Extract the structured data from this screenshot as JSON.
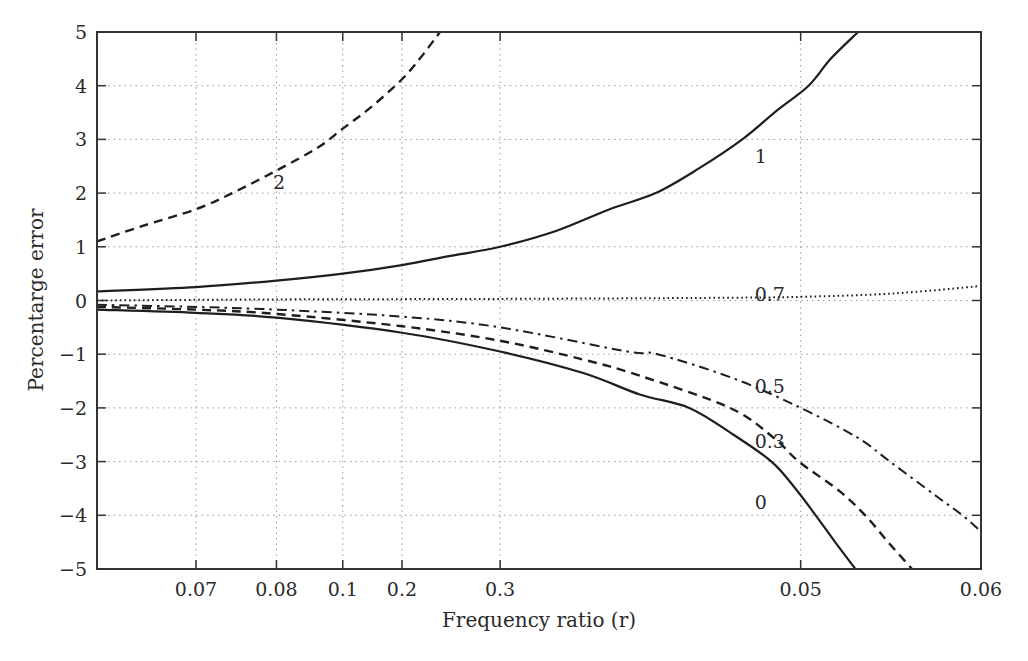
{
  "chart_data": {
    "type": "line",
    "title": "",
    "xlabel": "Frequency ratio (r)",
    "ylabel": "Percentarge error",
    "ylim": [
      -5,
      5
    ],
    "yticks": [
      -5,
      -4,
      -3,
      -2,
      -1,
      0,
      1,
      2,
      3,
      4,
      5
    ],
    "ytick_labels": [
      "−5",
      "−4",
      "−3",
      "−2",
      "−1",
      "0",
      "1",
      "2",
      "3",
      "4",
      "5"
    ],
    "grid": true,
    "grid_style": "dotted",
    "legend": "none (inline curve labels)",
    "x_axis_note": "non-uniform tick labels; positions given as fraction of plot width",
    "xticks": [
      {
        "label": "0.07",
        "pos": 0.112
      },
      {
        "label": "0.08",
        "pos": 0.203
      },
      {
        "label": "0.1",
        "pos": 0.278
      },
      {
        "label": "0.2",
        "pos": 0.345
      },
      {
        "label": "0.3",
        "pos": 0.456
      },
      {
        "label": "0.05",
        "pos": 0.796
      },
      {
        "label": "0.06",
        "pos": 1.0
      }
    ],
    "series": [
      {
        "name": "2",
        "style": "dashed",
        "points": [
          [
            0.0,
            1.1
          ],
          [
            0.05,
            1.38
          ],
          [
            0.112,
            1.7
          ],
          [
            0.153,
            2.0
          ],
          [
            0.203,
            2.42
          ],
          [
            0.25,
            2.85
          ],
          [
            0.278,
            3.2
          ],
          [
            0.31,
            3.6
          ],
          [
            0.345,
            4.12
          ],
          [
            0.365,
            4.5
          ],
          [
            0.388,
            5.0
          ]
        ],
        "label_pos": [
          0.19,
          2.2
        ]
      },
      {
        "name": "1",
        "style": "solid",
        "points": [
          [
            0.0,
            0.17
          ],
          [
            0.112,
            0.25
          ],
          [
            0.203,
            0.37
          ],
          [
            0.278,
            0.5
          ],
          [
            0.345,
            0.66
          ],
          [
            0.4,
            0.83
          ],
          [
            0.456,
            1.0
          ],
          [
            0.52,
            1.3
          ],
          [
            0.58,
            1.7
          ],
          [
            0.632,
            2.0
          ],
          [
            0.68,
            2.45
          ],
          [
            0.73,
            3.0
          ],
          [
            0.77,
            3.55
          ],
          [
            0.805,
            4.0
          ],
          [
            0.83,
            4.5
          ],
          [
            0.861,
            5.0
          ]
        ],
        "label_pos": [
          0.735,
          2.7
        ]
      },
      {
        "name": "0.7",
        "style": "dotted",
        "points": [
          [
            0.0,
            0.0
          ],
          [
            0.2,
            0.02
          ],
          [
            0.456,
            0.03
          ],
          [
            0.7,
            0.05
          ],
          [
            0.8,
            0.07
          ],
          [
            0.9,
            0.13
          ],
          [
            1.0,
            0.27
          ]
        ],
        "label_pos": [
          0.735,
          0.12
        ]
      },
      {
        "name": "0.5",
        "style": "dashdot",
        "points": [
          [
            0.0,
            -0.08
          ],
          [
            0.112,
            -0.12
          ],
          [
            0.203,
            -0.17
          ],
          [
            0.345,
            -0.3
          ],
          [
            0.456,
            -0.5
          ],
          [
            0.6,
            -0.95
          ],
          [
            0.634,
            -1.0
          ],
          [
            0.72,
            -1.45
          ],
          [
            0.796,
            -2.0
          ],
          [
            0.86,
            -2.55
          ],
          [
            0.897,
            -3.0
          ],
          [
            0.95,
            -3.65
          ],
          [
            0.979,
            -4.0
          ],
          [
            1.0,
            -4.3
          ]
        ],
        "label_pos": [
          0.735,
          -1.6
        ]
      },
      {
        "name": "0.3",
        "style": "dashed",
        "points": [
          [
            0.0,
            -0.12
          ],
          [
            0.112,
            -0.17
          ],
          [
            0.203,
            -0.25
          ],
          [
            0.345,
            -0.48
          ],
          [
            0.456,
            -0.75
          ],
          [
            0.55,
            -1.1
          ],
          [
            0.614,
            -1.4
          ],
          [
            0.716,
            -2.0
          ],
          [
            0.765,
            -2.55
          ],
          [
            0.794,
            -3.0
          ],
          [
            0.84,
            -3.55
          ],
          [
            0.869,
            -4.0
          ],
          [
            0.895,
            -4.5
          ],
          [
            0.922,
            -5.0
          ]
        ],
        "label_pos": [
          0.735,
          -2.62
        ]
      },
      {
        "name": "0",
        "style": "solid",
        "points": [
          [
            0.0,
            -0.17
          ],
          [
            0.112,
            -0.23
          ],
          [
            0.203,
            -0.32
          ],
          [
            0.345,
            -0.6
          ],
          [
            0.456,
            -0.95
          ],
          [
            0.55,
            -1.35
          ],
          [
            0.614,
            -1.75
          ],
          [
            0.67,
            -2.0
          ],
          [
            0.72,
            -2.5
          ],
          [
            0.763,
            -3.0
          ],
          [
            0.79,
            -3.5
          ],
          [
            0.813,
            -4.0
          ],
          [
            0.835,
            -4.5
          ],
          [
            0.858,
            -5.0
          ]
        ],
        "label_pos": [
          0.735,
          -3.75
        ]
      }
    ]
  }
}
